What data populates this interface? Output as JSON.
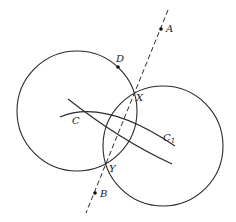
{
  "diagram": {
    "circles": [
      {
        "name": "left-circle",
        "cx": 77,
        "cy": 111,
        "r": 60
      },
      {
        "name": "right-circle",
        "cx": 163,
        "cy": 146,
        "r": 60
      }
    ],
    "line": {
      "name": "line-AB",
      "style": "dashed",
      "x1": 168,
      "y1": 10,
      "x2": 86,
      "y2": 213
    },
    "arcs": [
      {
        "name": "arc-through-C-upper",
        "d": "M60 117 Q104 98 175 146"
      },
      {
        "name": "arc-through-C-lower",
        "d": "M68 99 Q120 140 172 164"
      }
    ],
    "points": [
      {
        "id": "A",
        "x": 161,
        "y": 29,
        "dot": true
      },
      {
        "id": "D",
        "x": 118,
        "y": 67,
        "dot": true
      },
      {
        "id": "X",
        "x": 134,
        "y": 94,
        "dot": false
      },
      {
        "id": "Y",
        "x": 105,
        "y": 165,
        "dot": false
      },
      {
        "id": "B",
        "x": 95,
        "y": 193,
        "dot": true
      },
      {
        "id": "C",
        "x": 76,
        "y": 111,
        "dot": false
      },
      {
        "id": "C1",
        "x": 163,
        "y": 145,
        "dot": false
      }
    ],
    "labels": {
      "A": "A",
      "D": "D",
      "X": "X",
      "Y": "Y",
      "B": "B",
      "C": "C",
      "C1_main": "C",
      "C1_sub": "1"
    }
  }
}
